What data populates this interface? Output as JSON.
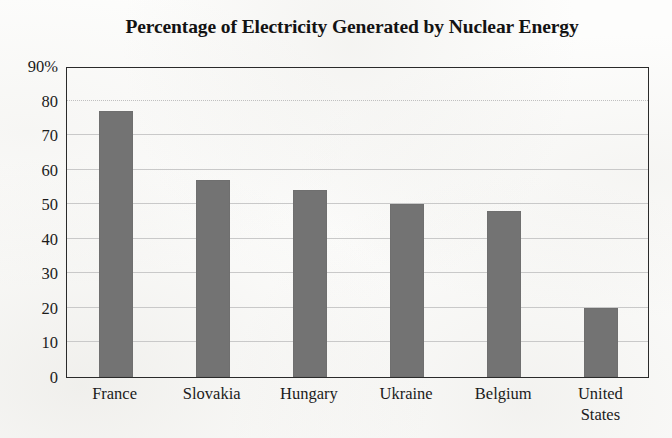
{
  "chart_data": {
    "type": "bar",
    "title": "Percentage of Electricity Generated by Nuclear Energy",
    "xlabel": "",
    "ylabel": "",
    "categories": [
      "France",
      "Slovakia",
      "Hungary",
      "Ukraine",
      "Belgium",
      "United States"
    ],
    "values": [
      77,
      57,
      54,
      50,
      48,
      20
    ],
    "ylim": [
      0,
      90
    ],
    "y_ticks": [
      0,
      10,
      20,
      30,
      40,
      50,
      60,
      70,
      80,
      90
    ],
    "y_tick_labels": [
      "0",
      "10",
      "20",
      "30",
      "40",
      "50",
      "60",
      "70",
      "80",
      "90%"
    ],
    "x_tick_labels": [
      [
        "France"
      ],
      [
        "Slovakia"
      ],
      [
        "Hungary"
      ],
      [
        "Ukraine"
      ],
      [
        "Belgium"
      ],
      [
        "United",
        "States"
      ]
    ],
    "grid": true,
    "legend": false,
    "legend_position": "none",
    "bar_color": "#737373",
    "axis_color": "#2a2a2a",
    "gridline_color": "#c9c9c9",
    "background_color": "#fdfdfc",
    "units": "percent"
  }
}
